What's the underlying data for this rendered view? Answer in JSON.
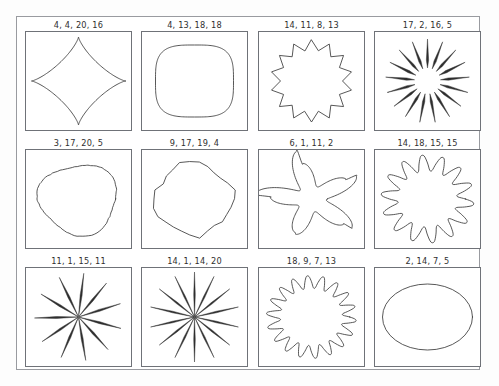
{
  "figure": {
    "background_color": "#fdfdfd",
    "frame_color": "#999ba0",
    "panel_border_color": "#6f7278",
    "stroke_color": "#3a3a3a",
    "columns": 4,
    "rows": 3
  },
  "chart_data": {
    "type": "table",
    "title": "",
    "xlabel": "",
    "ylabel": "",
    "categories": [
      "4, 4, 20, 16",
      "4, 13, 18, 18",
      "14, 11, 8, 13",
      "17, 2, 16, 5",
      "3, 17, 20, 5",
      "9, 17, 19, 4",
      "6, 1, 11, 2",
      "14, 18, 15, 15",
      "11, 1, 15, 11",
      "14, 1, 14, 20",
      "18, 9, 7, 13",
      "2, 14, 7, 5"
    ],
    "values": [
      4,
      4,
      14,
      17,
      3,
      9,
      6,
      14,
      11,
      14,
      18,
      2
    ]
  },
  "cells": [
    {
      "label": "4, 4, 20, 16",
      "shape": "four-pointed-concave-star",
      "params": [
        4,
        4,
        20,
        16
      ],
      "lobes": 4,
      "name": "shape-panel-1"
    },
    {
      "label": "4, 13, 18, 18",
      "shape": "rounded-square-cushion",
      "params": [
        4,
        13,
        18,
        18
      ],
      "lobes": 4,
      "name": "shape-panel-2"
    },
    {
      "label": "14, 11, 8, 13",
      "shape": "fourteen-point-star-rosette",
      "params": [
        14,
        11,
        8,
        13
      ],
      "lobes": 14,
      "name": "shape-panel-3"
    },
    {
      "label": "17, 2, 16, 5",
      "shape": "seventeen-spike-starburst",
      "params": [
        17,
        2,
        16,
        5
      ],
      "lobes": 17,
      "name": "shape-panel-4"
    },
    {
      "label": "3, 17, 20, 5",
      "shape": "rounded-triangular-blob",
      "params": [
        3,
        17,
        20,
        5
      ],
      "lobes": 3,
      "name": "shape-panel-5"
    },
    {
      "label": "9, 17, 19, 4",
      "shape": "nine-sided-irregular-polygon",
      "params": [
        9,
        17,
        19,
        4
      ],
      "lobes": 9,
      "name": "shape-panel-6"
    },
    {
      "label": "6, 1, 11, 2",
      "shape": "five-armed-starfish",
      "params": [
        6,
        1,
        11,
        2
      ],
      "lobes": 6,
      "name": "shape-panel-7"
    },
    {
      "label": "14, 18, 15, 15",
      "shape": "fourteen-point-scalloped-star",
      "params": [
        14,
        18,
        15,
        15
      ],
      "lobes": 14,
      "name": "shape-panel-8"
    },
    {
      "label": "11, 1, 15, 11",
      "shape": "eleven-ray-spike-burst",
      "params": [
        11,
        1,
        15,
        11
      ],
      "lobes": 11,
      "name": "shape-panel-9"
    },
    {
      "label": "14, 1, 14, 20",
      "shape": "fourteen-ray-spike-burst",
      "params": [
        14,
        1,
        14,
        20
      ],
      "lobes": 14,
      "name": "shape-panel-10"
    },
    {
      "label": "18, 9, 7, 13",
      "shape": "eighteen-point-wavy-star",
      "params": [
        18,
        9,
        7,
        13
      ],
      "lobes": 18,
      "name": "shape-panel-11"
    },
    {
      "label": "2, 14, 7, 5",
      "shape": "ellipse",
      "params": [
        2,
        14,
        7,
        5
      ],
      "lobes": 2,
      "name": "shape-panel-12"
    }
  ]
}
